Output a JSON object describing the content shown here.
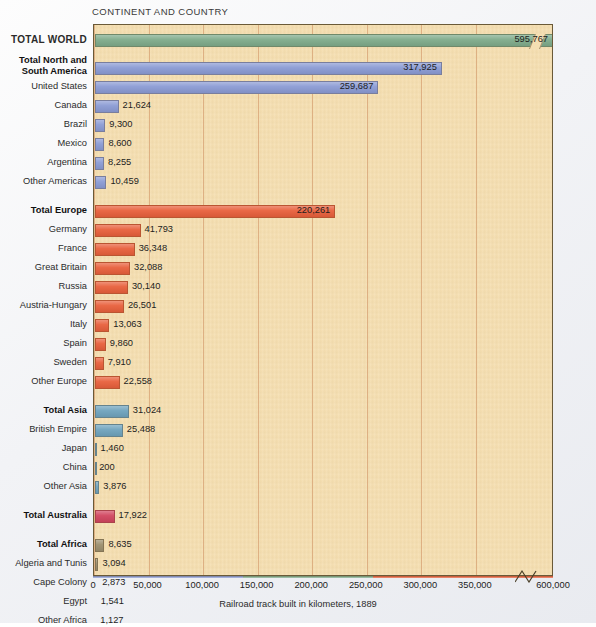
{
  "header": {
    "column_header": "CONTINENT AND COUNTRY"
  },
  "axis": {
    "title": "Railroad track built in kilometers, 1889",
    "ticks": [
      "0",
      "50,000",
      "100,000",
      "150,000",
      "200,000",
      "250,000",
      "300,000",
      "350,000",
      "600,000"
    ],
    "break_between": [
      "350,000",
      "600,000"
    ]
  },
  "colors": {
    "plot_background": "#f5dfb2",
    "gridline": "#d9a87a",
    "frame": "#6a5a38",
    "world": "#7fab8b",
    "americas": "#8b9bd4",
    "europe": "#e8603c",
    "asia": "#6fa3bd",
    "australia": "#d1455f",
    "africa": "#9c8f6e"
  },
  "chart_data": {
    "type": "bar",
    "title": "",
    "xlabel": "Railroad track built in kilometers, 1889",
    "ylabel": "CONTINENT AND COUNTRY",
    "orientation": "horizontal",
    "xlim": [
      0,
      600000
    ],
    "xticks": [
      0,
      50000,
      100000,
      150000,
      200000,
      250000,
      300000,
      350000,
      600000
    ],
    "axis_break": {
      "from": 360000,
      "to": 590000
    },
    "grid": "vertical",
    "legend": "none",
    "categories": [
      "TOTAL WORLD",
      "Total North and South America",
      "United States",
      "Canada",
      "Brazil",
      "Mexico",
      "Argentina",
      "Other Americas",
      "Total Europe",
      "Germany",
      "France",
      "Great Britain",
      "Russia",
      "Austria-Hungary",
      "Italy",
      "Spain",
      "Sweden",
      "Other Europe",
      "Total Asia",
      "British Empire",
      "Japan",
      "China",
      "Other Asia",
      "Total Australia",
      "Total Africa",
      "Algeria and Tunis",
      "Cape Colony",
      "Egypt",
      "Other Africa"
    ],
    "values": [
      595767,
      317925,
      259687,
      21624,
      9300,
      8600,
      8255,
      10459,
      220261,
      41793,
      36348,
      32088,
      30140,
      26501,
      13063,
      9860,
      7910,
      22558,
      31024,
      25488,
      1460,
      200,
      3876,
      17922,
      8635,
      3094,
      2873,
      1541,
      1127
    ],
    "value_labels": [
      "595,767",
      "317,925",
      "259,687",
      "21,624",
      "9,300",
      "8,600",
      "8,255",
      "10,459",
      "220,261",
      "41,793",
      "36,348",
      "32,088",
      "30,140",
      "26,501",
      "13,063",
      "9,860",
      "7,910",
      "22,558",
      "31,024",
      "25,488",
      "1,460",
      "200",
      "3,876",
      "17,922",
      "8,635",
      "3,094",
      "2,873",
      "1,541",
      "1,127"
    ],
    "groups": [
      "world",
      "americas",
      "americas",
      "americas",
      "americas",
      "americas",
      "americas",
      "americas",
      "europe",
      "europe",
      "europe",
      "europe",
      "europe",
      "europe",
      "europe",
      "europe",
      "europe",
      "europe",
      "asia",
      "asia",
      "asia",
      "asia",
      "asia",
      "australia",
      "africa",
      "africa",
      "africa",
      "africa",
      "africa"
    ]
  },
  "rows": [
    {
      "label": "TOTAL WORLD",
      "label2": "",
      "value": "595,767",
      "style": "caps",
      "group": "world",
      "y": 33,
      "inside": true
    },
    {
      "label": "Total North and",
      "label2": "South America",
      "value": "317,925",
      "style": "bold two-line",
      "group": "americas",
      "y": 61,
      "inside": true
    },
    {
      "label": "United States",
      "label2": "",
      "value": "259,687",
      "style": "",
      "group": "americas",
      "y": 80,
      "inside": true
    },
    {
      "label": "Canada",
      "label2": "",
      "value": "21,624",
      "style": "",
      "group": "americas",
      "y": 99,
      "inside": false
    },
    {
      "label": "Brazil",
      "label2": "",
      "value": "9,300",
      "style": "",
      "group": "americas",
      "y": 118,
      "inside": false
    },
    {
      "label": "Mexico",
      "label2": "",
      "value": "8,600",
      "style": "",
      "group": "americas",
      "y": 137,
      "inside": false
    },
    {
      "label": "Argentina",
      "label2": "",
      "value": "8,255",
      "style": "",
      "group": "americas",
      "y": 156,
      "inside": false
    },
    {
      "label": "Other Americas",
      "label2": "",
      "value": "10,459",
      "style": "",
      "group": "americas",
      "y": 175,
      "inside": false
    },
    {
      "label": "Total Europe",
      "label2": "",
      "value": "220,261",
      "style": "bold",
      "group": "europe",
      "y": 204,
      "inside": true
    },
    {
      "label": "Germany",
      "label2": "",
      "value": "41,793",
      "style": "",
      "group": "europe",
      "y": 223,
      "inside": false
    },
    {
      "label": "France",
      "label2": "",
      "value": "36,348",
      "style": "",
      "group": "europe",
      "y": 242,
      "inside": false
    },
    {
      "label": "Great Britain",
      "label2": "",
      "value": "32,088",
      "style": "",
      "group": "europe",
      "y": 261,
      "inside": false
    },
    {
      "label": "Russia",
      "label2": "",
      "value": "30,140",
      "style": "",
      "group": "europe",
      "y": 280,
      "inside": false
    },
    {
      "label": "Austria-Hungary",
      "label2": "",
      "value": "26,501",
      "style": "",
      "group": "europe",
      "y": 299,
      "inside": false
    },
    {
      "label": "Italy",
      "label2": "",
      "value": "13,063",
      "style": "",
      "group": "europe",
      "y": 318,
      "inside": false
    },
    {
      "label": "Spain",
      "label2": "",
      "value": "9,860",
      "style": "",
      "group": "europe",
      "y": 337,
      "inside": false
    },
    {
      "label": "Sweden",
      "label2": "",
      "value": "7,910",
      "style": "",
      "group": "europe",
      "y": 356,
      "inside": false
    },
    {
      "label": "Other Europe",
      "label2": "",
      "value": "22,558",
      "style": "",
      "group": "europe",
      "y": 375,
      "inside": false
    },
    {
      "label": "Total Asia",
      "label2": "",
      "value": "31,024",
      "style": "bold",
      "group": "asia",
      "y": 404,
      "inside": false
    },
    {
      "label": "British Empire",
      "label2": "",
      "value": "25,488",
      "style": "",
      "group": "asia",
      "y": 423,
      "inside": false
    },
    {
      "label": "Japan",
      "label2": "",
      "value": "1,460",
      "style": "",
      "group": "asia",
      "y": 442,
      "inside": false
    },
    {
      "label": "China",
      "label2": "",
      "value": "200",
      "style": "",
      "group": "asia",
      "y": 461,
      "inside": false
    },
    {
      "label": "Other Asia",
      "label2": "",
      "value": "3,876",
      "style": "",
      "group": "asia",
      "y": 480,
      "inside": false
    },
    {
      "label": "Total Australia",
      "label2": "",
      "value": "17,922",
      "style": "bold",
      "group": "australia",
      "y": 509,
      "inside": false
    },
    {
      "label": "Total Africa",
      "label2": "",
      "value": "8,635",
      "style": "bold",
      "group": "africa",
      "y": 538,
      "inside": false
    },
    {
      "label": "Algeria and Tunis",
      "label2": "",
      "value": "3,094",
      "style": "",
      "group": "africa",
      "y": 557,
      "inside": false
    },
    {
      "label": "Cape Colony",
      "label2": "",
      "value": "2,873",
      "style": "",
      "group": "africa",
      "y": 576,
      "inside": false
    },
    {
      "label": "Egypt",
      "label2": "",
      "value": "1,541",
      "style": "",
      "group": "africa",
      "y": 595,
      "inside": false
    },
    {
      "label": "Other Africa",
      "label2": "",
      "value": "1,127",
      "style": "",
      "group": "africa",
      "y": 614,
      "inside": false
    }
  ]
}
